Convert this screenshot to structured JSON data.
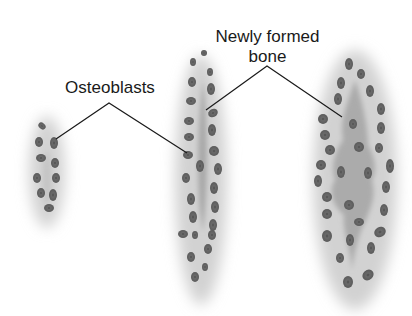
{
  "labels": {
    "osteoblasts": "Osteoblasts",
    "newly_formed_bone_line1": "Newly formed",
    "newly_formed_bone_line2": "bone"
  },
  "stages": [
    {
      "name": "early",
      "description": "Small cluster of osteoblasts with faint matrix"
    },
    {
      "name": "middle",
      "description": "Two rows of osteoblasts flanking a thin strip of newly formed bone"
    },
    {
      "name": "late",
      "description": "Osteoblasts surrounding a larger spindle of newly formed bone with embedded cells"
    }
  ],
  "colors": {
    "background": "#ffffff",
    "halo": "#d6d6d6",
    "bone_matrix": "#a8a8a8",
    "cell_fill": "#6e6e6e",
    "cell_nucleus": "#4a4a4a",
    "leader_line": "#1a1a1a"
  }
}
